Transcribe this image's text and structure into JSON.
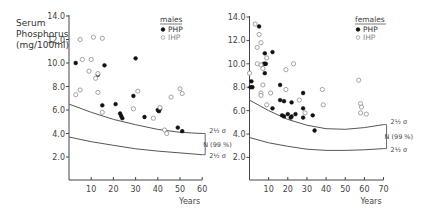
{
  "figure": {
    "ylabel_lines": [
      "Serum",
      "Phosphorus",
      "(mg/100ml)"
    ]
  },
  "chart_data": [
    {
      "type": "scatter",
      "title": "males",
      "xlabel": "Years",
      "ylabel": "Serum Phosphorus (mg/100ml)",
      "xlim": [
        0,
        60
      ],
      "ylim": [
        0,
        14
      ],
      "x_ticks": [
        10,
        20,
        30,
        40,
        50,
        60
      ],
      "y_ticks": [
        2.0,
        4.0,
        6.0,
        8.0,
        10.0,
        12.0,
        14.0
      ],
      "y_tick_labels": [
        "2.0",
        "4.0",
        "6.0",
        "8.0",
        "10.0",
        "12.0",
        "14.0"
      ],
      "grid": false,
      "legend": {
        "title": "males",
        "position": "upper right",
        "entries": [
          "PHP",
          "IHP"
        ]
      },
      "series": [
        {
          "name": "PHP",
          "marker": "filled-circle",
          "points": [
            [
              3,
              10.0
            ],
            [
              13,
              9.0
            ],
            [
              16,
              9.8
            ],
            [
              30,
              10.4
            ],
            [
              15,
              6.4
            ],
            [
              21,
              6.5
            ],
            [
              23,
              5.7
            ],
            [
              23.5,
              5.5
            ],
            [
              24,
              5.3
            ],
            [
              29,
              7.2
            ],
            [
              34,
              5.4
            ],
            [
              40,
              6.0
            ],
            [
              40.5,
              5.9
            ],
            [
              41,
              6.1
            ],
            [
              49,
              4.5
            ],
            [
              51,
              4.2
            ]
          ]
        },
        {
          "name": "IHP",
          "marker": "open-circle",
          "points": [
            [
              5,
              12.0
            ],
            [
              11,
              12.2
            ],
            [
              15,
              12.1
            ],
            [
              6,
              10.3
            ],
            [
              10,
              10.3
            ],
            [
              9,
              9.3
            ],
            [
              13,
              9.1
            ],
            [
              12,
              8.7
            ],
            [
              3,
              7.3
            ],
            [
              5,
              7.7
            ],
            [
              13,
              7.5
            ],
            [
              31,
              7.6
            ],
            [
              50,
              7.8
            ],
            [
              51,
              7.4
            ],
            [
              46,
              7.1
            ],
            [
              15,
              5.8
            ],
            [
              29,
              6.1
            ],
            [
              38,
              5.3
            ],
            [
              41,
              6.2
            ],
            [
              43,
              4.3
            ],
            [
              44,
              4.0
            ]
          ]
        }
      ],
      "reference_lines": [
        {
          "name": "upper 2½σ",
          "label": "2½ σ",
          "points": [
            [
              0,
              6.5
            ],
            [
              10,
              5.8
            ],
            [
              20,
              5.2
            ],
            [
              30,
              4.75
            ],
            [
              40,
              4.35
            ],
            [
              50,
              4.1
            ],
            [
              60,
              4.0
            ]
          ]
        },
        {
          "name": "lower 2½σ",
          "label": "2½ σ",
          "points": [
            [
              0,
              3.7
            ],
            [
              10,
              3.3
            ],
            [
              20,
              3.0
            ],
            [
              30,
              2.7
            ],
            [
              40,
              2.5
            ],
            [
              50,
              2.35
            ],
            [
              60,
              2.2
            ]
          ]
        }
      ],
      "annotations": [
        "2½ σ",
        "N (99 %)",
        "2½ σ"
      ]
    },
    {
      "type": "scatter",
      "title": "females",
      "xlabel": "Years",
      "ylabel": "Serum Phosphorus (mg/100ml)",
      "xlim": [
        0,
        70
      ],
      "ylim": [
        0,
        14
      ],
      "x_ticks": [
        10,
        20,
        30,
        40,
        50,
        60,
        70
      ],
      "y_ticks": [
        2.0,
        4.0,
        6.0,
        8.0,
        10.0,
        12.0,
        14.0
      ],
      "y_tick_labels": [
        "2.0",
        "4.0",
        "6.0",
        "8.0",
        "10.0",
        "12.0",
        "14.0"
      ],
      "grid": false,
      "legend": {
        "title": "females",
        "position": "upper right",
        "entries": [
          "PHP",
          "IHP"
        ]
      },
      "series": [
        {
          "name": "PHP",
          "marker": "filled-circle",
          "points": [
            [
              5,
              13.2
            ],
            [
              8,
              10.9
            ],
            [
              12,
              11.0
            ],
            [
              7.5,
              10.0
            ],
            [
              8,
              10.0
            ],
            [
              8.5,
              10.0
            ],
            [
              8,
              9.2
            ],
            [
              1,
              8.5
            ],
            [
              0.5,
              8.0
            ],
            [
              1.5,
              8.0
            ],
            [
              16,
              8.2
            ],
            [
              28,
              7.5
            ],
            [
              16,
              6.9
            ],
            [
              18,
              6.8
            ],
            [
              22,
              6.7
            ],
            [
              12,
              6.2
            ],
            [
              18,
              5.5
            ],
            [
              17,
              5.6
            ],
            [
              20,
              5.7
            ],
            [
              21.5,
              5.4
            ],
            [
              22,
              5.5
            ],
            [
              24,
              5.7
            ],
            [
              28,
              5.4
            ],
            [
              28,
              6.2
            ],
            [
              33,
              5.6
            ],
            [
              34,
              4.3
            ]
          ]
        },
        {
          "name": "IHP",
          "marker": "open-circle",
          "points": [
            [
              3,
              13.4
            ],
            [
              5,
              12.5
            ],
            [
              6,
              11.8
            ],
            [
              4,
              11.4
            ],
            [
              9,
              10.5
            ],
            [
              4,
              10.0
            ],
            [
              6,
              9.9
            ],
            [
              7,
              9.6
            ],
            [
              0,
              9.2
            ],
            [
              19,
              9.5
            ],
            [
              23,
              10.0
            ],
            [
              7,
              8.2
            ],
            [
              6,
              7.5
            ],
            [
              6,
              7.3
            ],
            [
              11,
              7.5
            ],
            [
              19,
              7.8
            ],
            [
              26,
              6.9
            ],
            [
              38,
              7.8
            ],
            [
              57,
              8.6
            ],
            [
              9,
              6.5
            ],
            [
              29,
              5.8
            ],
            [
              38.5,
              6.5
            ],
            [
              58,
              6.6
            ],
            [
              58.5,
              6.3
            ],
            [
              58,
              5.8
            ],
            [
              61,
              5.7
            ]
          ]
        }
      ],
      "reference_lines": [
        {
          "name": "upper 2½σ",
          "label": "2½ σ",
          "points": [
            [
              0,
              6.9
            ],
            [
              10,
              6.0
            ],
            [
              20,
              5.25
            ],
            [
              30,
              4.75
            ],
            [
              40,
              4.45
            ],
            [
              50,
              4.4
            ],
            [
              60,
              4.55
            ],
            [
              70,
              4.8
            ]
          ]
        },
        {
          "name": "lower 2½σ",
          "label": "2½ σ",
          "points": [
            [
              0,
              3.7
            ],
            [
              10,
              3.25
            ],
            [
              20,
              2.95
            ],
            [
              30,
              2.7
            ],
            [
              40,
              2.6
            ],
            [
              50,
              2.6
            ],
            [
              60,
              2.65
            ],
            [
              70,
              2.75
            ]
          ]
        }
      ],
      "annotations": [
        "2½ σ",
        "N (99 %)",
        "2½ σ"
      ]
    }
  ]
}
